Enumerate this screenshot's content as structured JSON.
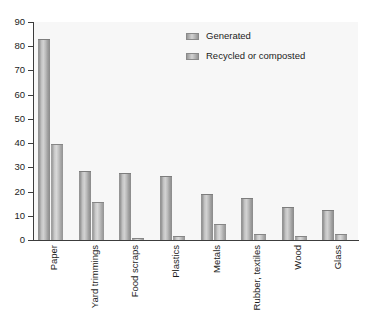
{
  "chart_data": {
    "type": "bar",
    "title": "",
    "subtitle": "",
    "xlabel": "",
    "ylabel": "",
    "ylim": [
      0,
      90
    ],
    "yticks": [
      0,
      10,
      20,
      30,
      40,
      50,
      60,
      70,
      80,
      90
    ],
    "grid": false,
    "legend_position": "top-center-right",
    "categories": [
      "Paper",
      "Yard trimmings",
      "Food scraps",
      "Plastics",
      "Metals",
      "Rubber, textiles",
      "Wood",
      "Glass"
    ],
    "series": [
      {
        "name": "Generated",
        "values": [
          83,
          28.5,
          27.5,
          26.5,
          19,
          17.5,
          13.5,
          12.5
        ]
      },
      {
        "name": "Recycled or composted",
        "values": [
          39.5,
          15.5,
          0.8,
          1.5,
          6.5,
          2.5,
          1.5,
          2.5
        ]
      }
    ]
  },
  "legend": {
    "items": [
      {
        "label": "Generated"
      },
      {
        "label": "Recycled or composted"
      }
    ]
  },
  "colors": {
    "plot_background": "#f7f7f7",
    "axis": "#3c3c3c",
    "text": "#1c1c1c",
    "bar_generated": "#b5b5b5",
    "bar_recycled": "#c0c0c0"
  }
}
